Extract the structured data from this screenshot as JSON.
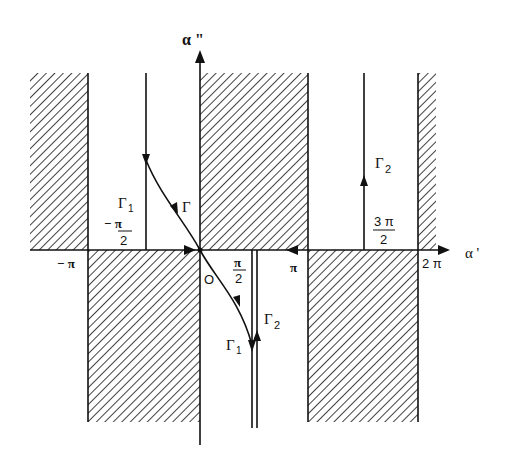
{
  "diagram": {
    "axes": {
      "x_label": "α '",
      "y_label": "α \"",
      "origin_label": "O"
    },
    "ticks": {
      "neg_pi": "− π",
      "neg_half_pi_num": "− π",
      "neg_half_pi_den": "2",
      "half_pi_num": "π",
      "half_pi_den": "2",
      "pi": "π",
      "three_half_pi_num": "3 π",
      "three_half_pi_den": "2",
      "two_pi": "2 π"
    },
    "curves": {
      "gamma": "Γ",
      "gamma1_upper": "Γ",
      "gamma1_upper_sub": "1",
      "gamma1_lower": "Γ",
      "gamma1_lower_sub": "1",
      "gamma2_upper": "Γ",
      "gamma2_upper_sub": "2",
      "gamma2_lower": "Γ",
      "gamma2_lower_sub": "2"
    },
    "colors": {
      "ink": "#111111",
      "background": "#ffffff"
    }
  }
}
